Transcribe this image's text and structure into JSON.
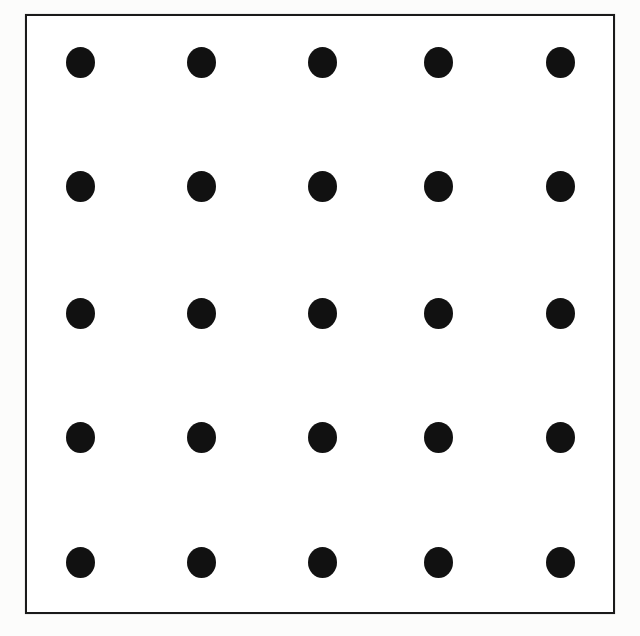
{
  "figure": {
    "canvas": {
      "width": 640,
      "height": 636,
      "background": "#fdfdfd"
    },
    "frame": {
      "x": 25,
      "y": 14,
      "width": 590,
      "height": 600,
      "stroke_color": "#1a1a1a",
      "stroke_width": 2,
      "fill_color": "#ffffff"
    },
    "dot_style": {
      "color": "#111111",
      "width": 29,
      "height": 31,
      "shape": "ellipse"
    }
  },
  "chart_data": {
    "type": "scatter",
    "xlabel": "",
    "ylabel": "",
    "grid": false,
    "legend": false,
    "rows": 5,
    "columns": 5,
    "column_centers_x": [
      80,
      201,
      322,
      438,
      560
    ],
    "row_centers_y": [
      62,
      186,
      313,
      437,
      562
    ],
    "column_spacing": 120,
    "row_spacing": 125,
    "marker_color": "#111111",
    "marker_width": 29,
    "marker_height": 31,
    "xlim": [
      25,
      615
    ],
    "ylim": [
      14,
      614
    ],
    "points": [
      {
        "row": 1,
        "col": 1,
        "x": 80,
        "y": 62
      },
      {
        "row": 1,
        "col": 2,
        "x": 201,
        "y": 62
      },
      {
        "row": 1,
        "col": 3,
        "x": 322,
        "y": 62
      },
      {
        "row": 1,
        "col": 4,
        "x": 438,
        "y": 62
      },
      {
        "row": 1,
        "col": 5,
        "x": 560,
        "y": 62
      },
      {
        "row": 2,
        "col": 1,
        "x": 80,
        "y": 186
      },
      {
        "row": 2,
        "col": 2,
        "x": 201,
        "y": 186
      },
      {
        "row": 2,
        "col": 3,
        "x": 322,
        "y": 186
      },
      {
        "row": 2,
        "col": 4,
        "x": 438,
        "y": 186
      },
      {
        "row": 2,
        "col": 5,
        "x": 560,
        "y": 186
      },
      {
        "row": 3,
        "col": 1,
        "x": 80,
        "y": 313
      },
      {
        "row": 3,
        "col": 2,
        "x": 201,
        "y": 313
      },
      {
        "row": 3,
        "col": 3,
        "x": 322,
        "y": 313
      },
      {
        "row": 3,
        "col": 4,
        "x": 438,
        "y": 313
      },
      {
        "row": 3,
        "col": 5,
        "x": 560,
        "y": 313
      },
      {
        "row": 4,
        "col": 1,
        "x": 80,
        "y": 437
      },
      {
        "row": 4,
        "col": 2,
        "x": 201,
        "y": 437
      },
      {
        "row": 4,
        "col": 3,
        "x": 322,
        "y": 437
      },
      {
        "row": 4,
        "col": 4,
        "x": 438,
        "y": 437
      },
      {
        "row": 4,
        "col": 5,
        "x": 560,
        "y": 437
      },
      {
        "row": 5,
        "col": 1,
        "x": 80,
        "y": 562
      },
      {
        "row": 5,
        "col": 2,
        "x": 201,
        "y": 562
      },
      {
        "row": 5,
        "col": 3,
        "x": 322,
        "y": 562
      },
      {
        "row": 5,
        "col": 4,
        "x": 438,
        "y": 562
      },
      {
        "row": 5,
        "col": 5,
        "x": 560,
        "y": 562
      }
    ]
  }
}
